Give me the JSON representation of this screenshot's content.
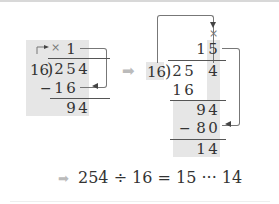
{
  "left_step": {
    "divisor": "16",
    "dividend": [
      "2",
      "5",
      "4"
    ],
    "quotient": [
      "1"
    ],
    "multiply_mark": "×",
    "subtract_sign": "−",
    "product": [
      "1",
      "6"
    ],
    "remainder": [
      "9",
      "4"
    ]
  },
  "right_step": {
    "divisor": "16",
    "dividend": [
      "2",
      "5",
      "4"
    ],
    "quotient": [
      "1",
      "5"
    ],
    "multiply_mark": "×",
    "first_product": [
      "1",
      "6"
    ],
    "partial": [
      "9",
      "4"
    ],
    "subtract_sign": "−",
    "second_product": [
      "8",
      "0"
    ],
    "remainder": [
      "1",
      "4"
    ]
  },
  "arrow_glyph": "➡",
  "result": {
    "equation": "254 ÷ 16 = 15 ··· 14"
  },
  "colors": {
    "shade": "#e6e6e6",
    "text": "#333333",
    "arrow": "#bbbbbb",
    "connector": "#777777"
  }
}
